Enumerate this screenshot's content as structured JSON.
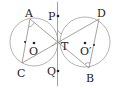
{
  "diagram": {
    "type": "geometry",
    "colors": {
      "stroke": "#9a9a9a",
      "text": "#222222",
      "point": "#222222"
    },
    "circles": [
      {
        "name": "O",
        "label": "O",
        "cx": 34,
        "cy": 42,
        "r": 24
      },
      {
        "name": "O'",
        "label": "O′",
        "cx": 85,
        "cy": 42,
        "r": 25
      }
    ],
    "points": {
      "A": {
        "label": "A",
        "x": 30,
        "y": 19
      },
      "C": {
        "label": "C",
        "x": 22,
        "y": 63
      },
      "T": {
        "label": "T",
        "x": 57,
        "y": 37
      },
      "D": {
        "label": "D",
        "x": 99,
        "y": 19
      },
      "B": {
        "label": "B",
        "x": 89,
        "y": 68
      },
      "P": {
        "label": "P",
        "x": 58,
        "y": 16
      },
      "Q": {
        "label": "Q",
        "x": 58,
        "y": 71
      }
    },
    "labels": {
      "A": "A",
      "C": "C",
      "T": "T",
      "D": "D",
      "B": "B",
      "P": "P",
      "Q": "Q",
      "O": "O",
      "O2": "O′"
    }
  }
}
